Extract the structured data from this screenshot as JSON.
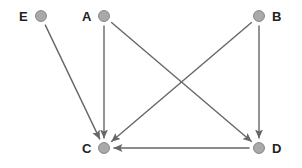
{
  "diagram": {
    "type": "directed-graph",
    "node_color": "#a9a9a9",
    "edge_color": "#666666",
    "nodes": [
      {
        "id": "E",
        "label": "E",
        "x": 41,
        "y": 16,
        "label_side": "left"
      },
      {
        "id": "A",
        "label": "A",
        "x": 104,
        "y": 16,
        "label_side": "left"
      },
      {
        "id": "B",
        "label": "B",
        "x": 259,
        "y": 16,
        "label_side": "right"
      },
      {
        "id": "C",
        "label": "C",
        "x": 104,
        "y": 148,
        "label_side": "left"
      },
      {
        "id": "D",
        "label": "D",
        "x": 259,
        "y": 148,
        "label_side": "right"
      }
    ],
    "edges": [
      {
        "from": "E",
        "to": "C"
      },
      {
        "from": "A",
        "to": "C"
      },
      {
        "from": "A",
        "to": "D"
      },
      {
        "from": "B",
        "to": "C"
      },
      {
        "from": "B",
        "to": "D"
      },
      {
        "from": "D",
        "to": "C"
      }
    ]
  }
}
